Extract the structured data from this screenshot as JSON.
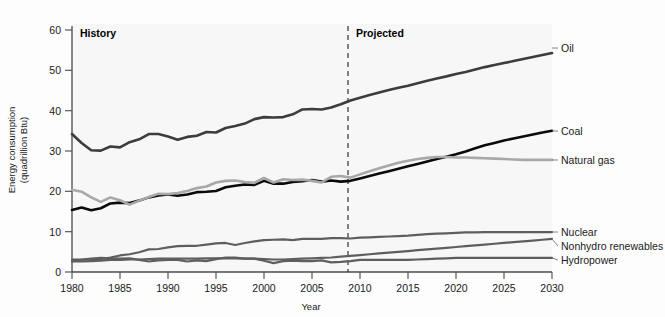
{
  "chart_data": {
    "type": "line",
    "title": "",
    "xlabel": "Year",
    "ylabel": "Energy consumption\n(quadrillion Btu)",
    "ylabel_line1": "Energy consumption",
    "ylabel_line2": "(quadrillion Btu)",
    "xlim": [
      1980,
      2030
    ],
    "ylim": [
      0,
      60
    ],
    "xticks": [
      1980,
      1985,
      1990,
      1995,
      2000,
      2005,
      2010,
      2015,
      2020,
      2025,
      2030
    ],
    "yticks": [
      0,
      10,
      20,
      30,
      40,
      50,
      60
    ],
    "grid": false,
    "legend_position": "right-inline-labels",
    "annotations": [
      {
        "text": "History",
        "x": 1982,
        "y": 57.5,
        "bold": true
      },
      {
        "text": "Projected",
        "x": 2010,
        "y": 57.5,
        "bold": true
      }
    ],
    "divider": {
      "x": 2009,
      "style": "dashed",
      "label_left": "History",
      "label_right": "Projected"
    },
    "x": [
      1980,
      1981,
      1982,
      1983,
      1984,
      1985,
      1986,
      1987,
      1988,
      1989,
      1990,
      1991,
      1992,
      1993,
      1994,
      1995,
      1996,
      1997,
      1998,
      1999,
      2000,
      2001,
      2002,
      2003,
      2004,
      2005,
      2006,
      2007,
      2008,
      2009,
      2010,
      2011,
      2012,
      2013,
      2014,
      2015,
      2016,
      2017,
      2018,
      2019,
      2020,
      2021,
      2022,
      2023,
      2024,
      2025,
      2026,
      2027,
      2028,
      2029,
      2030
    ],
    "series": [
      {
        "name": "Oil",
        "color": "#3c3c3c",
        "width": 2.6,
        "values": [
          34.2,
          32.0,
          30.2,
          30.1,
          31.1,
          30.9,
          32.2,
          32.9,
          34.2,
          34.2,
          33.6,
          32.8,
          33.5,
          33.8,
          34.7,
          34.6,
          35.7,
          36.2,
          36.8,
          37.9,
          38.4,
          38.3,
          38.4,
          39.1,
          40.3,
          40.4,
          40.3,
          40.8,
          41.6,
          42.5,
          43.2,
          43.9,
          44.5,
          45.1,
          45.7,
          46.2,
          46.8,
          47.4,
          48.0,
          48.5,
          49.1,
          49.6,
          50.2,
          50.8,
          51.3,
          51.8,
          52.3,
          52.8,
          53.3,
          53.8,
          54.3
        ]
      },
      {
        "name": "Coal",
        "color": "#0a0a0a",
        "width": 2.6,
        "values": [
          15.4,
          16.0,
          15.3,
          15.8,
          17.0,
          17.2,
          17.1,
          17.7,
          18.5,
          19.0,
          19.2,
          18.9,
          19.2,
          19.8,
          19.9,
          20.1,
          21.0,
          21.4,
          21.7,
          21.6,
          22.6,
          21.9,
          21.9,
          22.3,
          22.5,
          22.8,
          22.4,
          22.7,
          22.4,
          22.6,
          23.2,
          23.8,
          24.4,
          25.0,
          25.6,
          26.2,
          26.8,
          27.4,
          28.0,
          28.6,
          29.2,
          29.9,
          30.7,
          31.4,
          32.0,
          32.6,
          33.1,
          33.6,
          34.1,
          34.6,
          35.0
        ]
      },
      {
        "name": "Natural gas",
        "color": "#a8a8a8",
        "width": 2.6,
        "values": [
          20.4,
          19.9,
          18.5,
          17.4,
          18.5,
          17.8,
          16.7,
          17.7,
          18.6,
          19.4,
          19.3,
          19.6,
          20.1,
          20.8,
          21.2,
          22.2,
          22.6,
          22.7,
          22.3,
          22.1,
          23.3,
          22.2,
          23.0,
          22.8,
          22.9,
          22.6,
          22.2,
          23.6,
          23.8,
          23.4,
          24.2,
          25.0,
          25.7,
          26.4,
          27.1,
          27.6,
          28.0,
          28.3,
          28.5,
          28.5,
          28.4,
          28.4,
          28.3,
          28.2,
          28.1,
          28.0,
          27.9,
          27.8,
          27.8,
          27.8,
          27.8
        ]
      },
      {
        "name": "Nuclear",
        "color": "#5e5e5e",
        "width": 2.2,
        "values": [
          2.7,
          3.0,
          3.1,
          3.2,
          3.6,
          4.1,
          4.4,
          4.9,
          5.6,
          5.7,
          6.1,
          6.4,
          6.5,
          6.5,
          6.8,
          7.1,
          7.2,
          6.7,
          7.2,
          7.6,
          7.9,
          8.0,
          8.1,
          7.9,
          8.2,
          8.2,
          8.2,
          8.4,
          8.4,
          8.3,
          8.5,
          8.6,
          8.7,
          8.8,
          8.9,
          9.0,
          9.2,
          9.4,
          9.5,
          9.6,
          9.7,
          9.8,
          9.8,
          9.9,
          9.9,
          9.9,
          9.9,
          9.9,
          9.9,
          9.9,
          9.9
        ]
      },
      {
        "name": "Nonhydro renewables",
        "color": "#5e5e5e",
        "width": 2.2,
        "values": [
          2.6,
          2.6,
          2.7,
          2.8,
          3.0,
          3.0,
          3.1,
          3.1,
          3.2,
          3.3,
          3.3,
          3.3,
          3.3,
          3.3,
          3.4,
          3.4,
          3.4,
          3.4,
          3.3,
          3.3,
          3.2,
          3.1,
          3.1,
          3.2,
          3.3,
          3.4,
          3.5,
          3.6,
          3.8,
          4.0,
          4.2,
          4.4,
          4.6,
          4.8,
          5.0,
          5.2,
          5.4,
          5.6,
          5.8,
          6.0,
          6.2,
          6.4,
          6.6,
          6.8,
          7.0,
          7.2,
          7.4,
          7.6,
          7.8,
          8.0,
          8.2
        ]
      },
      {
        "name": "Hydropower",
        "color": "#5e5e5e",
        "width": 2.2,
        "values": [
          3.1,
          3.1,
          3.3,
          3.5,
          3.4,
          3.3,
          3.4,
          3.0,
          2.6,
          2.9,
          3.0,
          3.0,
          2.6,
          2.9,
          2.7,
          3.2,
          3.6,
          3.6,
          3.3,
          3.3,
          2.8,
          2.2,
          2.7,
          2.8,
          2.7,
          2.7,
          2.9,
          2.4,
          2.5,
          2.7,
          3.0,
          3.0,
          3.0,
          3.0,
          3.0,
          3.0,
          3.1,
          3.2,
          3.3,
          3.4,
          3.5,
          3.5,
          3.5,
          3.5,
          3.5,
          3.5,
          3.5,
          3.5,
          3.5,
          3.5,
          3.5
        ]
      }
    ]
  },
  "labels": {
    "oil": "Oil",
    "coal": "Coal",
    "natural_gas": "Natural gas",
    "nuclear": "Nuclear",
    "nonhydro": "Nonhydro renewables",
    "hydropower": "Hydropower",
    "history": "History",
    "projected": "Projected",
    "x_axis": "Year",
    "y_axis_line1": "Energy consumption",
    "y_axis_line2": "(quadrillion Btu)"
  },
  "yticks": {
    "t0": "0",
    "t10": "10",
    "t20": "20",
    "t30": "30",
    "t40": "40",
    "t50": "50",
    "t60": "60"
  },
  "xticks": {
    "t1980": "1980",
    "t1985": "1985",
    "t1990": "1990",
    "t1995": "1995",
    "t2000": "2000",
    "t2005": "2005",
    "t2010": "2010",
    "t2015": "2015",
    "t2020": "2020",
    "t2025": "2025",
    "t2030": "2030"
  }
}
